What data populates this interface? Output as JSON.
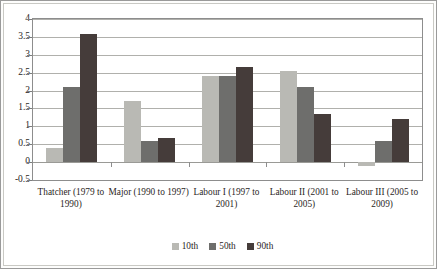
{
  "chart_data": {
    "type": "bar",
    "title": "",
    "subtitle": "",
    "xlabel": "",
    "ylabel": "",
    "ylim": [
      -0.5,
      4
    ],
    "ytick_step": 0.5,
    "yticks": [
      "4",
      "3.5",
      "3",
      "2.5",
      "2",
      "1.5",
      "1",
      "0.5",
      "0",
      "-0.5"
    ],
    "grid": true,
    "legend_position": "bottom",
    "categories": [
      "Thatcher (1979 to 1990)",
      "Major (1990 to 1997)",
      "Labour I (1997 to 2001)",
      "Labour II (2001 to 2005)",
      "Labour III (2005 to 2009)"
    ],
    "series": [
      {
        "name": "10th",
        "color": "#b9b9b4",
        "values": [
          0.4,
          1.7,
          2.4,
          2.55,
          -0.1
        ]
      },
      {
        "name": "50th",
        "color": "#6e6e6c",
        "values": [
          2.1,
          0.58,
          2.4,
          2.1,
          0.6
        ]
      },
      {
        "name": "90th",
        "color": "#453c3a",
        "values": [
          3.58,
          0.68,
          2.65,
          1.35,
          1.2
        ]
      }
    ]
  },
  "legend": {
    "items": [
      {
        "label": "10th"
      },
      {
        "label": "50th"
      },
      {
        "label": "90th"
      }
    ]
  }
}
